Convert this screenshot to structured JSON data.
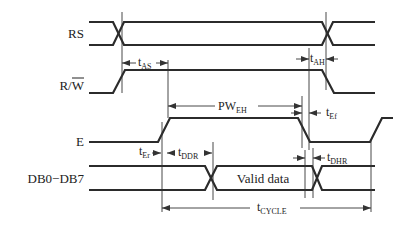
{
  "diagram": {
    "type": "timing-diagram",
    "signals": [
      {
        "name": "RS",
        "label": "RS"
      },
      {
        "name": "R/W",
        "label_r": "R/",
        "label_w": "W",
        "w_overline": true
      },
      {
        "name": "E",
        "label": "E"
      },
      {
        "name": "DB0-DB7",
        "label": "DB0−DB7"
      }
    ],
    "data_label": "Valid data",
    "timings": {
      "t_as": {
        "main": "t",
        "sub": "AS"
      },
      "t_ah": {
        "main": "t",
        "sub": "AH"
      },
      "pw_eh": {
        "main": "PW",
        "sub": "EH"
      },
      "t_ef": {
        "main": "t",
        "sub": "Ef"
      },
      "t_er": {
        "main": "t",
        "sub": "Er"
      },
      "t_ddr": {
        "main": "t",
        "sub": "DDR"
      },
      "t_dhr": {
        "main": "t",
        "sub": "DHR"
      },
      "t_cycle": {
        "main": "t",
        "sub": "CYCLE"
      }
    },
    "colors": {
      "line": "#2b2b2b",
      "text": "#222222",
      "background": "#ffffff"
    }
  }
}
